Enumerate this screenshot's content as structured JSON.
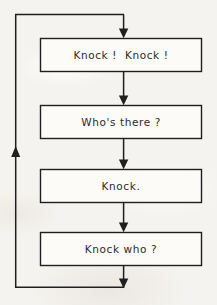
{
  "diagram": {
    "type": "flowchart",
    "background_color": "#f5f3ef",
    "line_color": "#1f1f1f",
    "text_color": "#2b2b2b",
    "box_fill": "#fbfaf7",
    "nodes": [
      {
        "id": "node-1",
        "label": "Knock !  Knock !",
        "x": 40,
        "y": 38,
        "width": 162,
        "height": 34
      },
      {
        "id": "node-2",
        "label": "Who's there ?",
        "x": 40,
        "y": 105,
        "width": 162,
        "height": 34
      },
      {
        "id": "node-3",
        "label": "Knock.",
        "x": 40,
        "y": 169,
        "width": 162,
        "height": 34
      },
      {
        "id": "node-4",
        "label": "Knock who ?",
        "x": 40,
        "y": 232,
        "width": 162,
        "height": 34
      }
    ],
    "connectors": [
      {
        "id": "arrow-entry",
        "from": "loop-top",
        "to": "node-1",
        "direction": "down"
      },
      {
        "id": "arrow-1-to-2",
        "from": "node-1",
        "to": "node-2",
        "direction": "down"
      },
      {
        "id": "arrow-2-to-3",
        "from": "node-2",
        "to": "node-3",
        "direction": "down"
      },
      {
        "id": "arrow-3-to-4",
        "from": "node-3",
        "to": "node-4",
        "direction": "down"
      },
      {
        "id": "arrow-exit",
        "from": "node-4",
        "to": "loop-bottom",
        "direction": "down"
      },
      {
        "id": "feedback-loop",
        "from": "node-4",
        "to": "node-1",
        "direction": "up"
      }
    ]
  }
}
